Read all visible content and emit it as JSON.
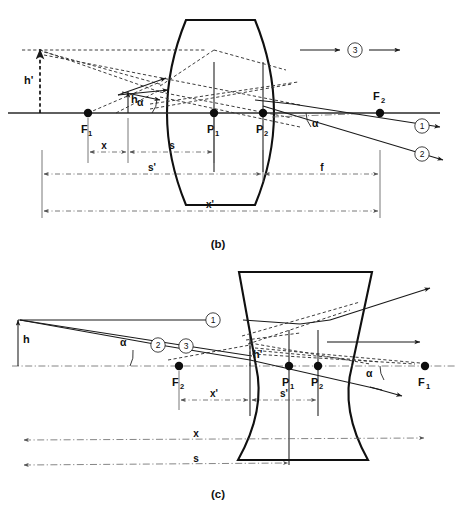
{
  "figure": {
    "panels": [
      {
        "id": "b",
        "caption": "(b)",
        "lens_type": "biconvex",
        "points": [
          {
            "name": "F1",
            "label": "F",
            "sub": "1"
          },
          {
            "name": "P1",
            "label": "P",
            "sub": "1"
          },
          {
            "name": "P2",
            "label": "P",
            "sub": "2"
          },
          {
            "name": "F2",
            "label": "F",
            "sub": "2"
          }
        ],
        "heights": [
          {
            "name": "object-height",
            "label": "h"
          },
          {
            "name": "image-height",
            "label": "h'"
          }
        ],
        "angles": [
          {
            "name": "alpha-left",
            "label": "α"
          },
          {
            "name": "alpha-right",
            "label": "α"
          }
        ],
        "dimensions": [
          {
            "name": "x",
            "label": "x"
          },
          {
            "name": "s",
            "label": "s"
          },
          {
            "name": "s-prime",
            "label": "s'"
          },
          {
            "name": "f",
            "label": "f"
          },
          {
            "name": "x-prime",
            "label": "x'"
          }
        ],
        "rays": [
          {
            "name": "ray-1",
            "label": "1"
          },
          {
            "name": "ray-2",
            "label": "2"
          },
          {
            "name": "ray-3",
            "label": "3"
          }
        ]
      },
      {
        "id": "c",
        "caption": "(c)",
        "lens_type": "biconcave",
        "points": [
          {
            "name": "F2",
            "label": "F",
            "sub": "2"
          },
          {
            "name": "P1",
            "label": "P",
            "sub": "1"
          },
          {
            "name": "P2",
            "label": "P",
            "sub": "2"
          },
          {
            "name": "F1",
            "label": "F",
            "sub": "1"
          }
        ],
        "heights": [
          {
            "name": "object-height",
            "label": "h"
          },
          {
            "name": "image-height",
            "label": "h'"
          }
        ],
        "angles": [
          {
            "name": "alpha-left",
            "label": "α"
          },
          {
            "name": "alpha-right",
            "label": "α"
          }
        ],
        "dimensions": [
          {
            "name": "x-prime",
            "label": "x'"
          },
          {
            "name": "s-prime",
            "label": "s'"
          },
          {
            "name": "x",
            "label": "x"
          },
          {
            "name": "s",
            "label": "s"
          }
        ],
        "rays": [
          {
            "name": "ray-1",
            "label": "1"
          },
          {
            "name": "ray-2",
            "label": "2"
          },
          {
            "name": "ray-3",
            "label": "3"
          }
        ]
      }
    ],
    "colors": {
      "ink": "#1a1a1a",
      "dim": "#555555",
      "background": "#ffffff"
    }
  }
}
